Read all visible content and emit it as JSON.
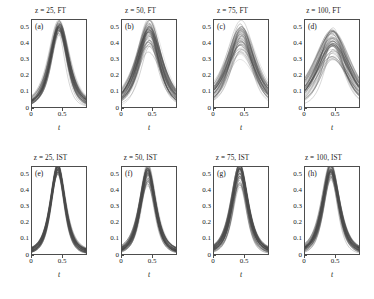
{
  "figure": {
    "rows": 2,
    "cols": 4,
    "background": "#ffffff",
    "curve_color": "#4a4a4a"
  },
  "axes": {
    "xlabel": "t",
    "ylabel": "",
    "xlim": [
      0,
      0.9
    ],
    "ylim": [
      0,
      0.55
    ],
    "xticks": [
      0,
      0.5
    ],
    "xticklabels": [
      "0",
      "0.5"
    ],
    "yticks": [
      0,
      0.1,
      0.2,
      0.3,
      0.4,
      0.5
    ],
    "yticklabels": [
      "0",
      "0.1",
      "0.2",
      "0.3",
      "0.4",
      "0.5"
    ],
    "grid": false
  },
  "chart_data": {
    "type": "line",
    "title": "",
    "xlabel": "t",
    "ylabel": "",
    "xlim": [
      0,
      0.9
    ],
    "ylim": [
      0,
      0.55
    ],
    "grid": false,
    "legend": "none",
    "panels": [
      {
        "letter": "(a)",
        "title": "z = 25, FT",
        "method": "FT",
        "z": 25,
        "row": 0,
        "col": 0,
        "n_curves": 60,
        "peak_t": 0.45,
        "peak_value_range": [
          0.44,
          0.5
        ],
        "width_range": [
          0.2,
          0.24
        ],
        "spread": "narrow"
      },
      {
        "letter": "(b)",
        "title": "z = 50, FT",
        "method": "FT",
        "z": 50,
        "row": 0,
        "col": 1,
        "n_curves": 60,
        "peak_t": 0.45,
        "peak_value_range": [
          0.33,
          0.51
        ],
        "width_range": [
          0.22,
          0.34
        ],
        "spread": "moderate"
      },
      {
        "letter": "(c)",
        "title": "z = 75, FT",
        "method": "FT",
        "z": 75,
        "row": 0,
        "col": 2,
        "n_curves": 60,
        "peak_t": 0.45,
        "peak_value_range": [
          0.28,
          0.5
        ],
        "width_range": [
          0.24,
          0.4
        ],
        "spread": "wide"
      },
      {
        "letter": "(d)",
        "title": "z = 100, FT",
        "method": "FT",
        "z": 100,
        "row": 0,
        "col": 3,
        "n_curves": 60,
        "peak_t": 0.46,
        "peak_value_range": [
          0.24,
          0.47
        ],
        "width_range": [
          0.26,
          0.46
        ],
        "spread": "widest"
      },
      {
        "letter": "(e)",
        "title": "z = 25, IST",
        "method": "IST",
        "z": 25,
        "row": 1,
        "col": 0,
        "n_curves": 60,
        "peak_t": 0.43,
        "peak_value_range": [
          0.49,
          0.52
        ],
        "width_range": [
          0.17,
          0.19
        ],
        "spread": "very narrow"
      },
      {
        "letter": "(f)",
        "title": "z = 50, IST",
        "method": "IST",
        "z": 50,
        "row": 1,
        "col": 1,
        "n_curves": 60,
        "peak_t": 0.43,
        "peak_value_range": [
          0.4,
          0.53
        ],
        "width_range": [
          0.17,
          0.21
        ],
        "spread": "narrow"
      },
      {
        "letter": "(g)",
        "title": "z = 75, IST",
        "method": "IST",
        "z": 75,
        "row": 1,
        "col": 2,
        "n_curves": 60,
        "peak_t": 0.43,
        "peak_value_range": [
          0.4,
          0.53
        ],
        "width_range": [
          0.17,
          0.22
        ],
        "spread": "narrow"
      },
      {
        "letter": "(h)",
        "title": "z = 100, IST",
        "method": "IST",
        "z": 100,
        "row": 1,
        "col": 3,
        "n_curves": 60,
        "peak_t": 0.43,
        "peak_value_range": [
          0.42,
          0.53
        ],
        "width_range": [
          0.18,
          0.23
        ],
        "spread": "narrow"
      }
    ]
  }
}
